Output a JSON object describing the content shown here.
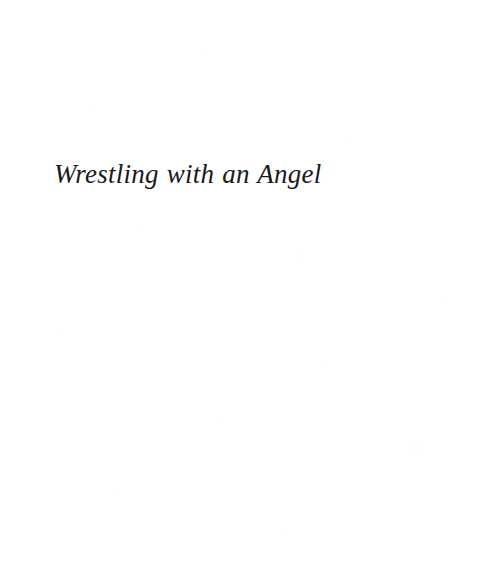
{
  "page": {
    "kind": "book-part-title-page",
    "width": 495,
    "height": 582,
    "background_color": "#ffffff",
    "text_color": "#1a1a1a"
  },
  "content": {
    "title": "Wrestling with an Angel"
  }
}
